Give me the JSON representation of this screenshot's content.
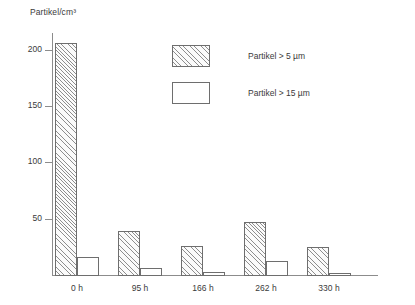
{
  "chart_data": {
    "type": "bar",
    "title": "Partikel/cm³",
    "xlabel": "",
    "ylabel": "Partikel/cm³",
    "categories": [
      "0 h",
      "95 h",
      "166 h",
      "262 h",
      "330 h"
    ],
    "series": [
      {
        "name": "Partikel > 5 µm",
        "values": [
          207,
          40,
          27,
          48,
          26
        ],
        "fill": "hatched"
      },
      {
        "name": "Partikel > 15 µm",
        "values": [
          17,
          7,
          4,
          13,
          3
        ],
        "fill": "open"
      }
    ],
    "ylim": [
      0,
      215
    ],
    "yticks": [
      50,
      100,
      150,
      200
    ],
    "ytick_labels": [
      "50",
      "100",
      "150",
      "200"
    ],
    "grid": false,
    "legend_position": "upper-center"
  },
  "legend": {
    "items": [
      {
        "label": "Partikel > 5 µm",
        "style": "hatched"
      },
      {
        "label": "Partikel > 15 µm",
        "style": "open"
      }
    ]
  },
  "colors": {
    "axis": "#8c8c8c",
    "text": "#3a3a3a",
    "bar_edge": "#6e6e6e",
    "hatch": "#8e8e8e",
    "background": "#ffffff"
  }
}
